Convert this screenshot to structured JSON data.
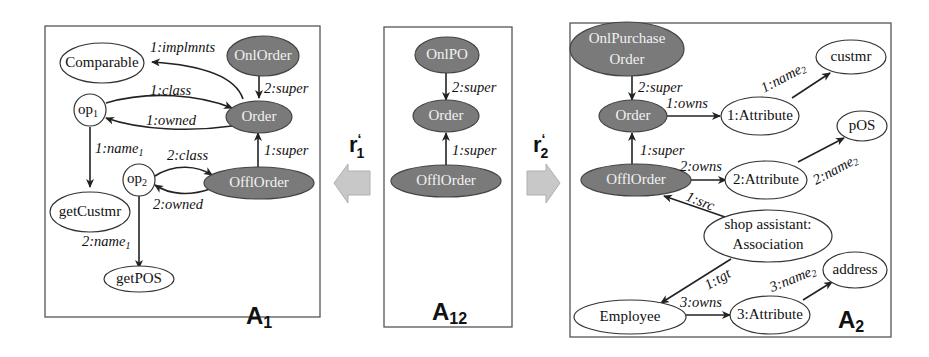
{
  "panels": {
    "A1": {
      "label": "A",
      "subscript": "1",
      "nodes": {
        "comparable": "Comparable",
        "onlorder": "OnlOrder",
        "order": "Order",
        "op1": "op",
        "op1_sub": "1",
        "op2": "op",
        "op2_sub": "2",
        "offlorder": "OfflOrder",
        "getcustmr": "getCustmr",
        "getpos": "getPOS"
      },
      "edges": {
        "implmnts": "1:implmnts",
        "super2": "2:super",
        "class1": "1:class",
        "owned1": "1:owned",
        "name1_1": "1:name",
        "name1_1_sub": "1",
        "class2": "2:class",
        "super1": "1:super",
        "owned2": "2:owned",
        "name1_2": "2:name",
        "name1_2_sub": "1"
      }
    },
    "A12": {
      "label": "A",
      "subscript": "12",
      "nodes": {
        "onlpo": "OnlPO",
        "order": "Order",
        "offlorder": "OfflOrder"
      },
      "edges": {
        "super2": "2:super",
        "super1": "1:super"
      }
    },
    "A2": {
      "label": "A",
      "subscript": "2",
      "nodes": {
        "onlpurchase_line1": "OnlPurchase",
        "onlpurchase_line2": "Order",
        "order": "Order",
        "attr1": "1:Attribute",
        "custmr": "custmr",
        "pos": "pOS",
        "offlorder": "OfflOrder",
        "attr2": "2:Attribute",
        "assoc_line1": "shop assistant:",
        "assoc_line2": "Association",
        "address": "address",
        "employee": "Employee",
        "attr3": "3:Attribute"
      },
      "edges": {
        "super2": "2:super",
        "owns1": "1:owns",
        "name2_1": "1:name",
        "name2_1_sub": "2",
        "super1": "1:super",
        "owns2": "2:owns",
        "name2_2": "2:name",
        "name2_2_sub": "2",
        "src": "1:src",
        "tgt": "1:tgt",
        "name2_3": "3:name",
        "name2_3_sub": "2",
        "owns3": "3:owns"
      }
    }
  },
  "arrows": {
    "r1": {
      "label": "r",
      "prime": "‘",
      "subscript": "1",
      "direction": "left"
    },
    "r2": {
      "label": "r",
      "prime": "‘",
      "subscript": "2",
      "direction": "right"
    }
  },
  "colors": {
    "dark_node_fill": "#7a7a7a",
    "light_node_fill": "#ffffff",
    "arrow_fill": "#c8c8c8",
    "border": "#555555"
  }
}
